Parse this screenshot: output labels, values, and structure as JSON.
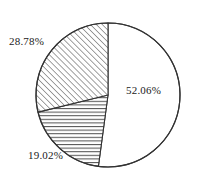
{
  "chart_data": {
    "type": "pie",
    "title": "",
    "subtitle": "",
    "xlabel": "",
    "ylabel": "",
    "legend_position": "none",
    "grid": false,
    "labels_shown_on_slices": true,
    "start_angle_deg": 90,
    "direction": "clockwise",
    "categories": [
      "52.06%",
      "19.02%",
      "28.78%"
    ],
    "values": [
      52.06,
      19.02,
      28.78
    ],
    "slices": [
      {
        "label": "52.06%",
        "value": 52.06,
        "fill": "white",
        "pattern": "none",
        "stroke": "#333333",
        "position": "right"
      },
      {
        "label": "19.02%",
        "value": 19.02,
        "fill": "white",
        "pattern": "horizontal-hatch",
        "stroke": "#333333",
        "position": "bottom-left"
      },
      {
        "label": "28.78%",
        "value": 28.78,
        "fill": "white",
        "pattern": "diagonal-hatch",
        "stroke": "#333333",
        "position": "upper-left"
      }
    ]
  },
  "labels": {
    "major": "52.06%",
    "diagonal": "28.78%",
    "horizontal": "19.02%"
  },
  "colors": {
    "background": "#ffffff",
    "outline": "#333333",
    "hatch": "#555555",
    "text": "#1a1a1a"
  },
  "geometry": {
    "center_x": 108,
    "center_y": 95,
    "radius": 72
  }
}
